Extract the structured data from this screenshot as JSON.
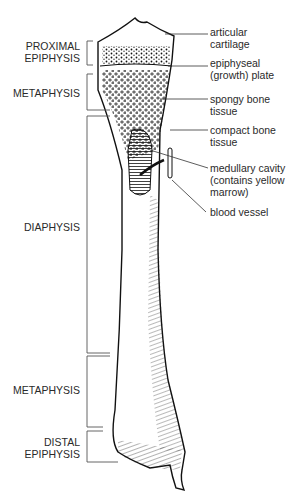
{
  "figure": {
    "left_labels": [
      {
        "id": "proximal-epiphysis",
        "line1": "PROXIMAL",
        "line2": "EPIPHYSIS"
      },
      {
        "id": "metaphysis-upper",
        "line1": "METAPHYSIS",
        "line2": ""
      },
      {
        "id": "diaphysis",
        "line1": "DIAPHYSIS",
        "line2": ""
      },
      {
        "id": "metaphysis-lower",
        "line1": "METAPHYSIS",
        "line2": ""
      },
      {
        "id": "distal-epiphysis",
        "line1": "DISTAL",
        "line2": "EPIPHYSIS"
      }
    ],
    "right_labels": [
      {
        "id": "articular-cartilage",
        "line1": "articular",
        "line2": "cartilage",
        "line3": ""
      },
      {
        "id": "epiphyseal-plate",
        "line1": "epiphyseal",
        "line2": "(growth) plate",
        "line3": ""
      },
      {
        "id": "spongy-bone",
        "line1": "spongy bone",
        "line2": "tissue",
        "line3": ""
      },
      {
        "id": "compact-bone",
        "line1": "compact bone",
        "line2": "tissue",
        "line3": ""
      },
      {
        "id": "medullary-cavity",
        "line1": "medullary cavity",
        "line2": "(contains yellow",
        "line3": "marrow)"
      },
      {
        "id": "blood-vessel",
        "line1": "blood vessel",
        "line2": "",
        "line3": ""
      }
    ],
    "colors": {
      "line": "#555555",
      "ink": "#111111",
      "text": "#2a2a2a"
    }
  }
}
